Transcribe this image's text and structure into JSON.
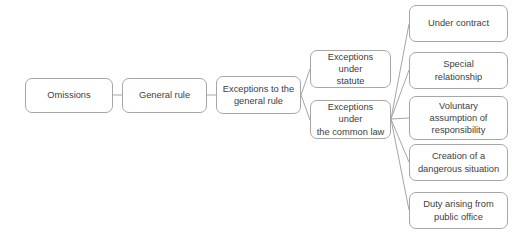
{
  "diagram": {
    "type": "flowchart",
    "orientation": "left-to-right",
    "style": {
      "background_color": "#ffffff",
      "node_fill": "#ffffff",
      "node_border_color": "#a6a6a6",
      "connector_color": "#a6a6a6",
      "text_color": "#404040"
    },
    "nodes": [
      {
        "id": "omissions",
        "label": "Omissions",
        "x": 25,
        "y": 78,
        "width": 88,
        "height": 35
      },
      {
        "id": "general-rule",
        "label": "General rule",
        "x": 122,
        "y": 78,
        "width": 85,
        "height": 35
      },
      {
        "id": "exceptions-to-the-general-rule",
        "label": "Exceptions to the\ngeneral rule",
        "x": 216,
        "y": 76,
        "width": 85,
        "height": 38
      },
      {
        "id": "exceptions-under-statute",
        "label": "Exceptions under\nstatute",
        "x": 310,
        "y": 50,
        "width": 81,
        "height": 38
      },
      {
        "id": "exceptions-under-the-common-law",
        "label": "Exceptions under\nthe common law",
        "x": 310,
        "y": 100,
        "width": 81,
        "height": 39
      },
      {
        "id": "under-contract",
        "label": "Under contract",
        "x": 409,
        "y": 5,
        "width": 99,
        "height": 37
      },
      {
        "id": "special-relationship",
        "label": "Special\nrelationship",
        "x": 409,
        "y": 52,
        "width": 99,
        "height": 37
      },
      {
        "id": "voluntary-assumption-of-responsibility",
        "label": "Voluntary\nassumption of\nresponsibility",
        "x": 409,
        "y": 96,
        "width": 99,
        "height": 44
      },
      {
        "id": "creation-of-a-dangerous-situation",
        "label": "Creation of a\ndangerous situation",
        "x": 409,
        "y": 144,
        "width": 99,
        "height": 37
      },
      {
        "id": "duty-arising-from-public-office",
        "label": "Duty arising from\npublic office",
        "x": 409,
        "y": 192,
        "width": 99,
        "height": 37
      }
    ],
    "connectors": [
      {
        "id": "omissions-to-general-rule",
        "from": "omissions",
        "to": "general-rule",
        "x1": 113,
        "y1": 95,
        "x2": 122,
        "y2": 95
      },
      {
        "id": "general-rule-to-exceptions",
        "from": "general-rule",
        "to": "exceptions-to-the-general-rule",
        "x1": 207,
        "y1": 95,
        "x2": 216,
        "y2": 95
      },
      {
        "id": "exceptions-to-statute",
        "from": "exceptions-to-the-general-rule",
        "to": "exceptions-under-statute",
        "x1": 301,
        "y1": 95,
        "x2": 310,
        "y2": 69
      },
      {
        "id": "exceptions-to-common-law",
        "from": "exceptions-to-the-general-rule",
        "to": "exceptions-under-the-common-law",
        "x1": 301,
        "y1": 95,
        "x2": 310,
        "y2": 120
      },
      {
        "id": "common-law-to-under-contract",
        "from": "exceptions-under-the-common-law",
        "to": "under-contract",
        "x1": 391,
        "y1": 119,
        "x2": 409,
        "y2": 24
      },
      {
        "id": "common-law-to-special-relationship",
        "from": "exceptions-under-the-common-law",
        "to": "special-relationship",
        "x1": 391,
        "y1": 119,
        "x2": 409,
        "y2": 70
      },
      {
        "id": "common-law-to-voluntary-assumption",
        "from": "exceptions-under-the-common-law",
        "to": "voluntary-assumption-of-responsibility",
        "x1": 391,
        "y1": 119,
        "x2": 409,
        "y2": 118
      },
      {
        "id": "common-law-to-creation-of-danger",
        "from": "exceptions-under-the-common-law",
        "to": "creation-of-a-dangerous-situation",
        "x1": 391,
        "y1": 119,
        "x2": 409,
        "y2": 162
      },
      {
        "id": "common-law-to-duty-public-office",
        "from": "exceptions-under-the-common-law",
        "to": "duty-arising-from-public-office",
        "x1": 391,
        "y1": 119,
        "x2": 409,
        "y2": 210
      }
    ]
  }
}
